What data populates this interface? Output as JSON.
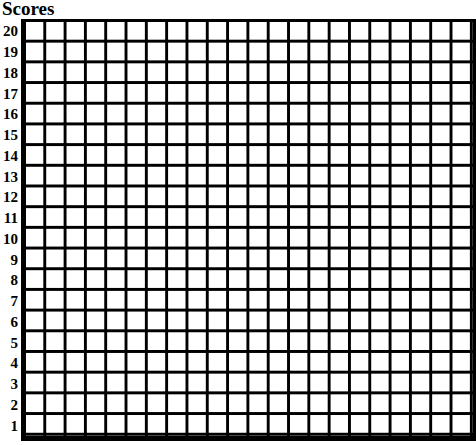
{
  "title": "Scores",
  "grid": {
    "rows": 20,
    "columns": 22,
    "line_color": "#000000",
    "background": "#ffffff"
  },
  "y_axis": {
    "labels": [
      "20",
      "19",
      "18",
      "17",
      "16",
      "15",
      "14",
      "13",
      "12",
      "11",
      "10",
      "9",
      "8",
      "7",
      "6",
      "5",
      "4",
      "3",
      "2",
      "1"
    ]
  }
}
